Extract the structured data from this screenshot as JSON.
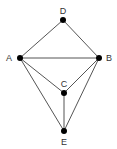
{
  "graph": {
    "nodes": [
      {
        "id": "D",
        "label": "D",
        "x": 63,
        "y": 20,
        "lx": 63,
        "ly": 14,
        "anchor": "middle"
      },
      {
        "id": "A",
        "label": "A",
        "x": 20,
        "y": 58,
        "lx": 9,
        "ly": 61,
        "anchor": "middle"
      },
      {
        "id": "B",
        "label": "B",
        "x": 99,
        "y": 58,
        "lx": 109,
        "ly": 61,
        "anchor": "middle"
      },
      {
        "id": "C",
        "label": "C",
        "x": 64,
        "y": 93,
        "lx": 64,
        "ly": 87,
        "anchor": "middle"
      },
      {
        "id": "E",
        "label": "E",
        "x": 64,
        "y": 131,
        "lx": 64,
        "ly": 145,
        "anchor": "middle"
      }
    ],
    "edges": [
      [
        "D",
        "A"
      ],
      [
        "D",
        "B"
      ],
      [
        "A",
        "B"
      ],
      [
        "A",
        "C"
      ],
      [
        "A",
        "E"
      ],
      [
        "B",
        "C"
      ],
      [
        "B",
        "E"
      ],
      [
        "C",
        "E"
      ]
    ]
  }
}
